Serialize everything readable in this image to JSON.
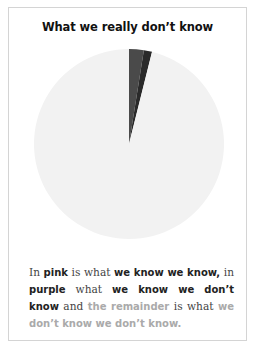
{
  "title": "What we really don’t know",
  "caption": {
    "p1": "In ",
    "b1": "pink",
    "p2": " is what ",
    "b2": "we know we know,",
    "p3": " in ",
    "b3": "purple",
    "p4": " what ",
    "b4": "we know we don’t know",
    "p5": " and ",
    "g1": "the remainder",
    "p6": " is what ",
    "g2": "we don’t know we don’t know."
  },
  "colors": {
    "pink": "#4a4a4a",
    "purple": "#2a2a2a",
    "remainder": "#f2f2f2"
  },
  "chart_data": {
    "type": "pie",
    "title": "What we really don’t know",
    "categories": [
      "we know we know",
      "we know we don’t know",
      "we don’t know we don’t know"
    ],
    "values": [
      2.5,
      1.4,
      96.1
    ],
    "colors_as_labelled": [
      "pink",
      "purple",
      "remainder"
    ],
    "start_angle": "12 o'clock, clockwise",
    "legend": "none (explained in caption)"
  }
}
